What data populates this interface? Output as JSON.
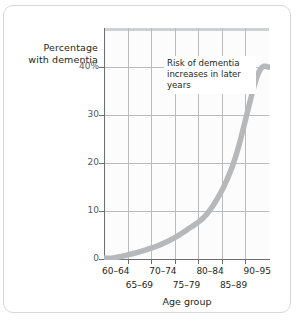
{
  "axis_titles": {
    "y_line1": "Percentage",
    "y_line2": "with dementia",
    "x": "Age group"
  },
  "annotation": {
    "text": "Risk of dementia increases in later years"
  },
  "colors": {
    "curve": "#b6b8ba",
    "grid": "#b9bbbd",
    "axis": "#6d6e70",
    "text": "#231f20",
    "card_border": "#d8d8d8",
    "plot_background": "#fcfcfc",
    "note_background": "#ffffff"
  },
  "chart_data": {
    "type": "line",
    "title": "",
    "subtitle": "",
    "xlabel": "Age group",
    "ylabel": "Percentage with dementia",
    "categories": [
      "60-64",
      "65-69",
      "70-74",
      "75-79",
      "80-84",
      "85-89",
      "90-95"
    ],
    "values": [
      0.3,
      1.5,
      3.2,
      6.0,
      10.2,
      20.0,
      38.0
    ],
    "ylim": [
      0,
      48
    ],
    "yticks": [
      0,
      10,
      20,
      30,
      40
    ],
    "ytick_labels": [
      "0",
      "10",
      "20",
      "30",
      "40%"
    ],
    "grid": true,
    "legend": "none",
    "annotations": [
      {
        "text": "Risk of dementia increases in later years",
        "x_category": "75-79",
        "y_value": 42
      }
    ]
  }
}
